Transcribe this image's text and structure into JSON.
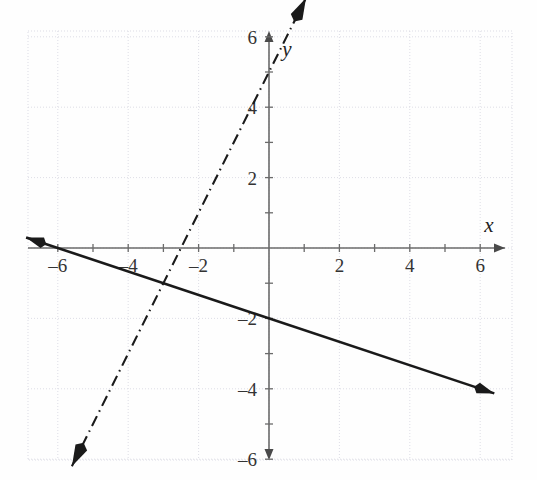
{
  "chart_data": {
    "type": "line",
    "title": "",
    "xlabel": "x",
    "ylabel": "y",
    "xlim": [
      -7,
      7
    ],
    "ylim": [
      -7,
      7
    ],
    "grid": true,
    "grid_step": 2,
    "legend": "none",
    "xticks": [
      -6,
      -4,
      -2,
      2,
      4,
      6
    ],
    "yticks": [
      6,
      4,
      2,
      -2,
      -4,
      -6
    ],
    "xtick_labels": [
      "–6",
      "–4",
      "–2",
      "2",
      "4",
      "6"
    ],
    "ytick_labels": [
      "6",
      "4",
      "2",
      "–2",
      "–4",
      "–6"
    ],
    "series": [
      {
        "name": "solid-line",
        "style": "solid",
        "slope": -0.3333,
        "intercept": -2,
        "x_intercept": -6,
        "y_intercept": -2,
        "arrows": "both",
        "x": [
          -6.9,
          6.4
        ],
        "y": [
          0.3,
          -4.13
        ]
      },
      {
        "name": "dash-dot-line",
        "style": "dashdot",
        "slope": 2,
        "intercept": 5,
        "x_intercept": -2.5,
        "y_intercept": 5,
        "arrows": "both",
        "x": [
          -5.6,
          1.05
        ],
        "y": [
          -6.2,
          7.1
        ]
      }
    ]
  },
  "axes": {
    "x_axis_label": "x",
    "y_axis_label": "y"
  },
  "colors": {
    "grid": "#d9d9e3",
    "axis": "#6b6b6b",
    "curve": "#1a1a1a",
    "text": "#333333",
    "background": "#fefefe"
  }
}
